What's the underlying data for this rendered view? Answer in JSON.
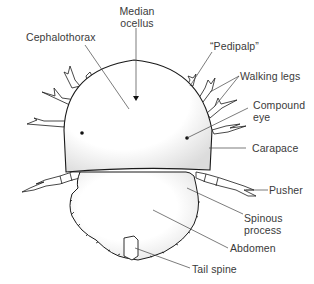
{
  "diagram": {
    "labels": {
      "median_ocellus": [
        "Median",
        "ocellus"
      ],
      "cephalothorax": "Cephalothorax",
      "pedipalp": "“Pedipalp”",
      "walking_legs": "Walking legs",
      "compound_eye": [
        "Compound",
        "eye"
      ],
      "carapace": "Carapace",
      "pusher": "Pusher",
      "spinous_process": [
        "Spinous",
        "process"
      ],
      "abdomen": "Abdomen",
      "tail_spine": "Tail spine"
    },
    "colors": {
      "outline": "#1a1a1a",
      "leader_line": "#444444",
      "label_text": "#3a3a3a",
      "fill": "#ffffff",
      "shade": "#e6e6e6"
    }
  }
}
